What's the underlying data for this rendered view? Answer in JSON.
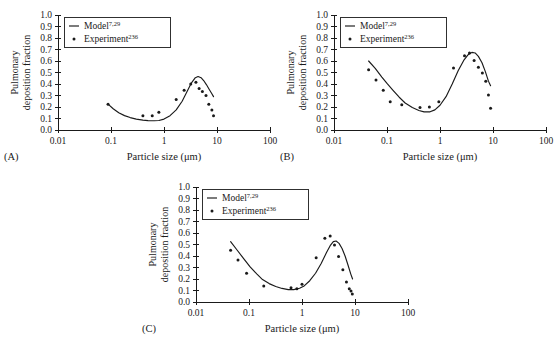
{
  "figure": {
    "panel_labels": [
      "(A)",
      "(B)",
      "(C)"
    ],
    "axis": {
      "xlabel": "Particle size (μm)",
      "ylabel_line1": "Pulmonary",
      "ylabel_line2": "deposition fraction",
      "x_ticklabels": [
        "0.01",
        "0.1",
        "1",
        "10",
        "100"
      ],
      "x_tickvalues": [
        0.01,
        0.1,
        1,
        10,
        100
      ],
      "y_ticklabels": [
        "0.0",
        "0.1",
        "0.2",
        "0.3",
        "0.4",
        "0.5",
        "0.6",
        "0.7",
        "0.8",
        "0.9",
        "1.0"
      ],
      "y_tickvalues": [
        0.0,
        0.1,
        0.2,
        0.3,
        0.4,
        0.5,
        0.6,
        0.7,
        0.8,
        0.9,
        1.0
      ],
      "xlim": [
        0.01,
        100
      ],
      "ylim": [
        0.0,
        1.0
      ],
      "xscale": "log",
      "grid": false
    },
    "legend": {
      "position": "upper-left-inside",
      "entries": [
        {
          "label": "Model",
          "sup": "7,29",
          "marker": "line"
        },
        {
          "label": "Experiment",
          "sup": "236",
          "marker": "dot"
        }
      ]
    },
    "colors": {
      "ink": "#1a1a1a",
      "background": "#ffffff"
    }
  },
  "chart_data": [
    {
      "id": "A",
      "type": "line",
      "title": "",
      "panel_label": "(A)",
      "xlabel": "Particle size (μm)",
      "ylabel": "Pulmonary deposition fraction",
      "xscale": "log",
      "xlim": [
        0.01,
        100
      ],
      "ylim": [
        0.0,
        1.0
      ],
      "grid": false,
      "legend": [
        "Model7,29",
        "Experiment236"
      ],
      "series": [
        {
          "name": "Model",
          "type": "line",
          "x": [
            0.088,
            0.11,
            0.14,
            0.18,
            0.23,
            0.3,
            0.4,
            0.5,
            0.65,
            0.8,
            1.0,
            1.3,
            1.7,
            2.2,
            2.8,
            3.3,
            3.9,
            4.4,
            5.0,
            5.6,
            6.3,
            7.1,
            8.0,
            8.6
          ],
          "y": [
            0.225,
            0.185,
            0.15,
            0.125,
            0.108,
            0.095,
            0.086,
            0.082,
            0.08,
            0.083,
            0.095,
            0.125,
            0.175,
            0.25,
            0.345,
            0.41,
            0.455,
            0.465,
            0.455,
            0.43,
            0.395,
            0.355,
            0.315,
            0.29
          ]
        },
        {
          "name": "Experiment",
          "type": "scatter",
          "x": [
            0.088,
            0.4,
            0.6,
            0.8,
            1.7,
            2.4,
            3.2,
            4.0,
            4.6,
            5.3,
            6.2,
            7.0,
            8.0,
            8.6
          ],
          "y": [
            0.225,
            0.125,
            0.125,
            0.155,
            0.265,
            0.345,
            0.4,
            0.415,
            0.36,
            0.335,
            0.3,
            0.225,
            0.175,
            0.125
          ]
        }
      ]
    },
    {
      "id": "B",
      "type": "line",
      "title": "",
      "panel_label": "(B)",
      "xlabel": "Particle size (μm)",
      "ylabel": "Pulmonary deposition fraction",
      "xscale": "log",
      "xlim": [
        0.01,
        100
      ],
      "ylim": [
        0.0,
        1.0
      ],
      "grid": false,
      "legend": [
        "Model7,29",
        "Experiment236"
      ],
      "series": [
        {
          "name": "Model",
          "type": "line",
          "x": [
            0.045,
            0.06,
            0.08,
            0.1,
            0.13,
            0.17,
            0.22,
            0.3,
            0.4,
            0.5,
            0.65,
            0.8,
            1.0,
            1.3,
            1.7,
            2.2,
            2.8,
            3.4,
            4.0,
            4.6,
            5.3,
            6.2,
            7.2,
            8.2,
            9.0
          ],
          "y": [
            0.6,
            0.535,
            0.46,
            0.405,
            0.345,
            0.285,
            0.235,
            0.195,
            0.17,
            0.158,
            0.158,
            0.175,
            0.215,
            0.29,
            0.4,
            0.515,
            0.605,
            0.655,
            0.675,
            0.67,
            0.64,
            0.585,
            0.505,
            0.425,
            0.385
          ]
        },
        {
          "name": "Experiment",
          "type": "scatter",
          "x": [
            0.045,
            0.062,
            0.085,
            0.115,
            0.19,
            0.42,
            0.63,
            0.95,
            1.8,
            2.9,
            3.6,
            4.4,
            5.3,
            6.3,
            7.3,
            8.2,
            9.0
          ],
          "y": [
            0.525,
            0.435,
            0.345,
            0.245,
            0.22,
            0.195,
            0.2,
            0.245,
            0.54,
            0.645,
            0.67,
            0.605,
            0.545,
            0.495,
            0.425,
            0.305,
            0.19
          ]
        }
      ]
    },
    {
      "id": "C",
      "type": "line",
      "title": "",
      "panel_label": "(C)",
      "xlabel": "Particle size (μm)",
      "ylabel": "Pulmonary deposition fraction",
      "xscale": "log",
      "xlim": [
        0.01,
        100
      ],
      "ylim": [
        0.0,
        1.0
      ],
      "grid": false,
      "legend": [
        "Model7,29",
        "Experiment236"
      ],
      "series": [
        {
          "name": "Model",
          "type": "line",
          "x": [
            0.045,
            0.06,
            0.08,
            0.105,
            0.14,
            0.18,
            0.24,
            0.32,
            0.42,
            0.55,
            0.7,
            0.9,
            1.1,
            1.4,
            1.8,
            2.3,
            2.9,
            3.4,
            3.9,
            4.4,
            5.0,
            5.7,
            6.5,
            7.4,
            8.3,
            9.0
          ],
          "y": [
            0.525,
            0.45,
            0.375,
            0.305,
            0.245,
            0.195,
            0.16,
            0.135,
            0.118,
            0.108,
            0.108,
            0.12,
            0.14,
            0.185,
            0.25,
            0.335,
            0.43,
            0.49,
            0.525,
            0.53,
            0.51,
            0.465,
            0.4,
            0.32,
            0.245,
            0.2
          ]
        },
        {
          "name": "Experiment",
          "type": "scatter",
          "x": [
            0.045,
            0.062,
            0.09,
            0.19,
            0.62,
            0.8,
            1.0,
            1.85,
            2.7,
            3.4,
            4.1,
            4.9,
            5.9,
            6.9,
            7.8,
            8.4,
            8.9
          ],
          "y": [
            0.45,
            0.365,
            0.25,
            0.14,
            0.125,
            0.115,
            0.155,
            0.385,
            0.555,
            0.575,
            0.495,
            0.395,
            0.28,
            0.175,
            0.115,
            0.095,
            0.07
          ]
        }
      ]
    }
  ]
}
